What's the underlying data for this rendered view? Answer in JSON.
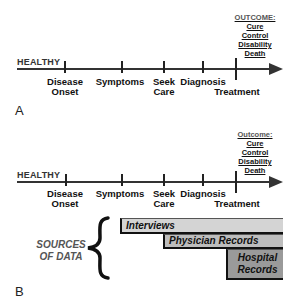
{
  "panel_a": {
    "label": "A",
    "start_label": "HEALTHY",
    "stages": [
      {
        "line1": "Disease",
        "line2": "Onset"
      },
      {
        "line1": "Symptoms",
        "line2": ""
      },
      {
        "line1": "Seek",
        "line2": "Care"
      },
      {
        "line1": "Diagnosis",
        "line2": ""
      },
      {
        "line1": "Treatment",
        "line2": ""
      }
    ],
    "outcome": {
      "heading": "OUTCOME:",
      "items": [
        "Cure",
        "Control",
        "Disability",
        "Death"
      ]
    }
  },
  "panel_b": {
    "label": "B",
    "start_label": "HEALTHY",
    "stages": [
      {
        "line1": "Disease",
        "line2": "Onset"
      },
      {
        "line1": "Symptoms",
        "line2": ""
      },
      {
        "line1": "Seek",
        "line2": "Care"
      },
      {
        "line1": "Diagnosis",
        "line2": ""
      },
      {
        "line1": "Treatment",
        "line2": ""
      }
    ],
    "outcome": {
      "heading": "Outcome:",
      "items": [
        "Cure",
        "Control",
        "Disability",
        "Death"
      ]
    },
    "sources": {
      "line1": "SOURCES",
      "line2": "OF DATA",
      "bars": [
        {
          "line1": "Interviews",
          "line2": "",
          "color": "#d4d4d4"
        },
        {
          "line1": "Physician Records",
          "line2": "",
          "color": "#bdbdbd"
        },
        {
          "line1": "Hospital",
          "line2": "Records",
          "color": "#9a9a9a"
        }
      ]
    }
  }
}
